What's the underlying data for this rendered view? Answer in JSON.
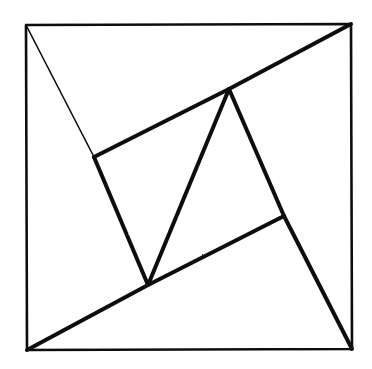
{
  "figure": {
    "canvas": {
      "width": 372,
      "height": 369
    },
    "background_color": "#ffffff",
    "ink_color": "#101010",
    "style": "hand-drawn scanned line art, no labels or text",
    "stroke_widths": {
      "outer_border": 2.6,
      "thick_line": 4.0,
      "thin_line": 1.6
    },
    "points": {
      "outer_top_left": {
        "x": 26,
        "y": 25
      },
      "outer_top_right": {
        "x": 351,
        "y": 24
      },
      "outer_bottom_right": {
        "x": 352,
        "y": 349
      },
      "outer_bottom_left": {
        "x": 27,
        "y": 350
      },
      "inner_left": {
        "x": 94,
        "y": 157
      },
      "inner_top": {
        "x": 229,
        "y": 89
      },
      "inner_right": {
        "x": 284,
        "y": 216
      },
      "inner_bottom": {
        "x": 148,
        "y": 285
      }
    },
    "shapes": {
      "outer_square": "26,25 351,24 352,349 27,350 26,25",
      "inner_square_left_edge": "94,157 148,285",
      "inner_square_top_edge": "94,157 229,89",
      "inner_square_right_edge": "229,89 284,216",
      "inner_square_bottom_edge": "284,216 148,285",
      "diagonal_thin_tl_to_left_vertex": "26,25 94,157",
      "diagonal_thick_bl_through_bottom_top_to_tr": "27,350 148,285 229,89 351,24",
      "diagonal_thick_right_vertex_to_br": "284,216 352,349"
    },
    "counts": {
      "outer_square_sides": 4,
      "inner_square_sides": 4,
      "corner_triangles": 4,
      "total_vertices": 8
    }
  },
  "chart_data": {
    "type": "diagram",
    "xlabel": "",
    "ylabel": "",
    "xlim": [
      0,
      372
    ],
    "ylim": [
      0,
      369
    ],
    "grid": false,
    "legend": "none",
    "annotations": [],
    "series": [
      {
        "name": "outer-square",
        "kind": "polygon",
        "closed": true,
        "stroke_width": 2.6,
        "points": [
          [
            26,
            25
          ],
          [
            351,
            24
          ],
          [
            352,
            349
          ],
          [
            27,
            350
          ]
        ]
      },
      {
        "name": "inner-tilted-square",
        "kind": "polygon",
        "closed": true,
        "stroke_width": 4.0,
        "points": [
          [
            94,
            157
          ],
          [
            229,
            89
          ],
          [
            284,
            216
          ],
          [
            148,
            285
          ]
        ]
      },
      {
        "name": "cevian-top-left-to-inner-left",
        "kind": "polyline",
        "closed": false,
        "stroke_width": 1.6,
        "points": [
          [
            26,
            25
          ],
          [
            94,
            157
          ]
        ]
      },
      {
        "name": "cevian-bottom-left-to-inner-bottom",
        "kind": "polyline",
        "closed": false,
        "stroke_width": 4.0,
        "points": [
          [
            27,
            350
          ],
          [
            148,
            285
          ]
        ]
      },
      {
        "name": "cevian-inner-top-to-top-right",
        "kind": "polyline",
        "closed": false,
        "stroke_width": 4.0,
        "points": [
          [
            229,
            89
          ],
          [
            351,
            24
          ]
        ]
      },
      {
        "name": "cevian-inner-right-to-bottom-right",
        "kind": "polyline",
        "closed": false,
        "stroke_width": 4.0,
        "points": [
          [
            284,
            216
          ],
          [
            352,
            349
          ]
        ]
      }
    ]
  }
}
